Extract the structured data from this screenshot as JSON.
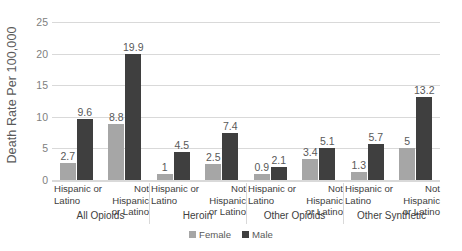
{
  "chart_data": {
    "type": "bar",
    "title": "",
    "subtitle": "",
    "xlabel": "",
    "ylabel": "Death Rate Per 100,000",
    "ylim": [
      0,
      25
    ],
    "yticks": [
      0,
      5,
      10,
      15,
      20,
      25
    ],
    "ytick_labels": [
      "0",
      "5",
      "10",
      "15",
      "20",
      "25"
    ],
    "grid": true,
    "legend_position": "bottom",
    "grouping": "grouped bars by ethnicity within drug category",
    "categories": [
      "Hispanic or Latino",
      "Not Hispanic or Latino",
      "Hispanic or Latino",
      "Not Hispanic or Latino",
      "Hispanic or Latino",
      "Not Hispanic or Latino",
      "Hispanic or Latino",
      "Not Hispanic or Latino"
    ],
    "category_lines": [
      [
        "Hispanic or",
        "Latino"
      ],
      [
        "Not Hispanic",
        "or Latino"
      ],
      [
        "Hispanic or",
        "Latino"
      ],
      [
        "Not Hispanic",
        "or Latino"
      ],
      [
        "Hispanic or",
        "Latino"
      ],
      [
        "Not Hispanic",
        "or Latino"
      ],
      [
        "Hispanic or",
        "Latino"
      ],
      [
        "Not Hispanic",
        "or Latino"
      ]
    ],
    "groups": [
      {
        "label": "All Opioids",
        "span": 2
      },
      {
        "label": "Heroin",
        "span": 2
      },
      {
        "label": "Other Opioids",
        "span": 2
      },
      {
        "label": "Other Synthetic",
        "span": 2
      }
    ],
    "series": [
      {
        "name": "Female",
        "color": "#a6a6a6",
        "values": [
          2.7,
          8.8,
          1,
          2.5,
          0.9,
          3.4,
          1.3,
          5
        ],
        "labels": [
          "2.7",
          "8.8",
          "1",
          "2.5",
          "0.9",
          "3.4",
          "1.3",
          "5"
        ]
      },
      {
        "name": "Male",
        "color": "#3f3f3f",
        "values": [
          9.6,
          19.9,
          4.5,
          7.4,
          2.1,
          5.1,
          5.7,
          13.2
        ],
        "labels": [
          "9.6",
          "19.9",
          "4.5",
          "7.4",
          "2.1",
          "5.1",
          "5.7",
          "13.2"
        ]
      }
    ]
  },
  "legend": {
    "items": [
      {
        "label": "Female",
        "swatch": "female"
      },
      {
        "label": "Male",
        "swatch": "male"
      }
    ]
  },
  "colors": {
    "female": "#a6a6a6",
    "male": "#3f3f3f",
    "gridline": "#d9d9d9",
    "tick_text": "#808080",
    "label_text": "#595959",
    "category_text": "#404040",
    "background": "#ffffff"
  }
}
